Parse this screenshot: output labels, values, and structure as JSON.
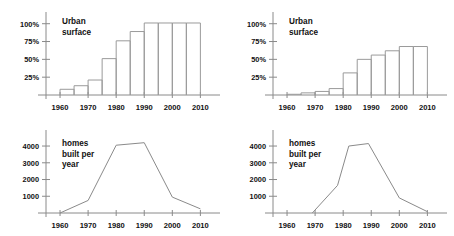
{
  "figure": {
    "background_color": "#ffffff",
    "stroke_color": "#8a8a8a",
    "text_color": "#111111",
    "panel_count": 4
  },
  "chart_data": [
    {
      "id": "urban-surface-left",
      "type": "bar",
      "title": "Urban surface",
      "title_lines": [
        "Urban",
        "surface"
      ],
      "xlabel": "",
      "ylabel": "",
      "grid": false,
      "legend": "none",
      "xlim": [
        1955,
        2012
      ],
      "ylim": [
        0,
        108
      ],
      "xticks": [
        1960,
        1970,
        1980,
        1990,
        2000,
        2010
      ],
      "xticklabels": [
        "1960",
        "1970",
        "1980",
        "1990",
        "2000",
        "2010"
      ],
      "yticks": [
        25,
        50,
        75,
        100
      ],
      "yticklabels": [
        "25%",
        "50%",
        "75%",
        "100%"
      ],
      "categories": [
        "1960-1965",
        "1965-1970",
        "1970-1975",
        "1975-1980",
        "1980-1985",
        "1985-1990",
        "1990-1995",
        "1995-2000",
        "2000-2005",
        "2005-2010"
      ],
      "bar_starts": [
        1960,
        1965,
        1970,
        1975,
        1980,
        1985,
        1990,
        1995,
        2000,
        2005
      ],
      "bar_ends": [
        1965,
        1970,
        1975,
        1980,
        1985,
        1990,
        1995,
        2000,
        2005,
        2010
      ],
      "values": [
        8,
        13,
        21,
        51,
        76,
        89,
        101,
        101,
        101,
        101
      ]
    },
    {
      "id": "urban-surface-right",
      "type": "bar",
      "title": "Urban surface",
      "title_lines": [
        "Urban",
        "surface"
      ],
      "xlabel": "",
      "ylabel": "",
      "grid": false,
      "legend": "none",
      "xlim": [
        1955,
        2012
      ],
      "ylim": [
        0,
        108
      ],
      "xticks": [
        1960,
        1970,
        1980,
        1990,
        2000,
        2010
      ],
      "xticklabels": [
        "1960",
        "1970",
        "1980",
        "1990",
        "2000",
        "2010"
      ],
      "yticks": [
        25,
        50,
        75,
        100
      ],
      "yticklabels": [
        "25%",
        "50%",
        "75%",
        "100%"
      ],
      "categories": [
        "1960-1965",
        "1965-1970",
        "1970-1975",
        "1975-1980",
        "1980-1985",
        "1985-1990",
        "1990-1995",
        "1995-2000",
        "2000-2005",
        "2005-2010"
      ],
      "bar_starts": [
        1960,
        1965,
        1970,
        1975,
        1980,
        1985,
        1990,
        1995,
        2000,
        2005
      ],
      "bar_ends": [
        1965,
        1970,
        1975,
        1980,
        1985,
        1990,
        1995,
        2000,
        2005,
        2010
      ],
      "values": [
        1,
        3,
        5,
        9,
        31,
        50,
        56,
        62,
        68,
        68
      ]
    },
    {
      "id": "homes-built-left",
      "type": "line",
      "title": "homes built per year",
      "title_lines": [
        "homes",
        "built per",
        "year"
      ],
      "xlabel": "",
      "ylabel": "",
      "grid": false,
      "legend": "none",
      "xlim": [
        1955,
        2012
      ],
      "ylim": [
        0,
        4600
      ],
      "xticks": [
        1960,
        1970,
        1980,
        1990,
        2000,
        2010
      ],
      "xticklabels": [
        "1960",
        "1970",
        "1980",
        "1990",
        "2000",
        "2010"
      ],
      "yticks": [
        1000,
        2000,
        3000,
        4000
      ],
      "yticklabels": [
        "1000",
        "2000",
        "3000",
        "4000"
      ],
      "x": [
        1960,
        1970,
        1980,
        1990,
        2000,
        2010
      ],
      "values": [
        0,
        750,
        4050,
        4200,
        950,
        250
      ]
    },
    {
      "id": "homes-built-right",
      "type": "line",
      "title": "homes built per year",
      "title_lines": [
        "homes",
        "built per",
        "year"
      ],
      "xlabel": "",
      "ylabel": "",
      "grid": false,
      "legend": "none",
      "xlim": [
        1955,
        2012
      ],
      "ylim": [
        0,
        4600
      ],
      "xticks": [
        1960,
        1970,
        1980,
        1990,
        2000,
        2010
      ],
      "xticklabels": [
        "1960",
        "1970",
        "1980",
        "1990",
        "2000",
        "2010"
      ],
      "yticks": [
        1000,
        2000,
        3000,
        4000
      ],
      "yticklabels": [
        "1000",
        "2000",
        "3000",
        "4000"
      ],
      "x": [
        1969,
        1978,
        1982,
        1989,
        2000,
        2010
      ],
      "values": [
        0,
        1650,
        4000,
        4150,
        900,
        80
      ]
    }
  ]
}
